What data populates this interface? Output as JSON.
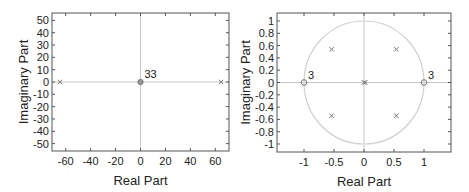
{
  "chart_data": [
    {
      "type": "scatter",
      "title": "",
      "xlabel": "Real Part",
      "ylabel": "Imaginary Part",
      "xlim": [
        -71,
        71
      ],
      "ylim": [
        -56,
        56
      ],
      "xticks": [
        -60,
        -40,
        -20,
        0,
        20,
        40,
        60
      ],
      "yticks": [
        50,
        40,
        30,
        20,
        10,
        0,
        -10,
        -20,
        -30,
        -40,
        -50
      ],
      "xtick_labels": [
        "-60",
        "-40",
        "-20",
        "0",
        "20",
        "40",
        "60"
      ],
      "ytick_labels": [
        "50",
        "40",
        "30",
        "20",
        "10",
        "0",
        "-10",
        "-20",
        "-30",
        "-40",
        "-50"
      ],
      "grid": false,
      "unit_circle": true,
      "series": [
        {
          "name": "Poles",
          "marker": "x",
          "points": [
            [
              -64.5,
              0
            ],
            [
              64.5,
              0
            ],
            [
              0,
              0
            ]
          ]
        },
        {
          "name": "Zeros",
          "marker": "o",
          "points": [
            [
              0,
              0
            ]
          ],
          "multiplicity_label": "33"
        }
      ],
      "annotations": [
        {
          "text": "33",
          "x": 0,
          "y": 0
        }
      ]
    },
    {
      "type": "scatter",
      "title": "",
      "xlabel": "Real Part",
      "ylabel": "Imaginary Part",
      "xlim": [
        -1.45,
        1.45
      ],
      "ylim": [
        -1.13,
        1.13
      ],
      "xticks": [
        -1,
        -0.5,
        0,
        0.5,
        1
      ],
      "yticks": [
        1,
        0.8,
        0.6,
        0.4,
        0.2,
        0,
        -0.2,
        -0.4,
        -0.6,
        -0.8,
        -1
      ],
      "xtick_labels": [
        "-1",
        "-0.5",
        "0",
        "0.5",
        "1"
      ],
      "ytick_labels": [
        "1",
        "0.8",
        "0.6",
        "0.4",
        "0.2",
        "0",
        "-0.2",
        "-0.4",
        "-0.6",
        "-0.8",
        "-1"
      ],
      "grid": false,
      "unit_circle": true,
      "series": [
        {
          "name": "Poles",
          "marker": "x",
          "points": [
            [
              -0.54,
              0.54
            ],
            [
              0.54,
              0.54
            ],
            [
              -0.54,
              -0.54
            ],
            [
              0.54,
              -0.54
            ],
            [
              0,
              0
            ],
            [
              0.02,
              0
            ]
          ]
        },
        {
          "name": "Zeros",
          "marker": "o",
          "points": [
            [
              -1,
              0
            ],
            [
              1,
              0
            ]
          ]
        }
      ],
      "annotations": [
        {
          "text": "3",
          "x": -1,
          "y": 0
        },
        {
          "text": "3",
          "x": 1,
          "y": 0
        }
      ]
    }
  ],
  "colors": {
    "frame": "#555555",
    "axis_line": "#c8c8c8",
    "unit_circle": "#d0d0d0",
    "marker": "#777777",
    "text": "#222222"
  }
}
